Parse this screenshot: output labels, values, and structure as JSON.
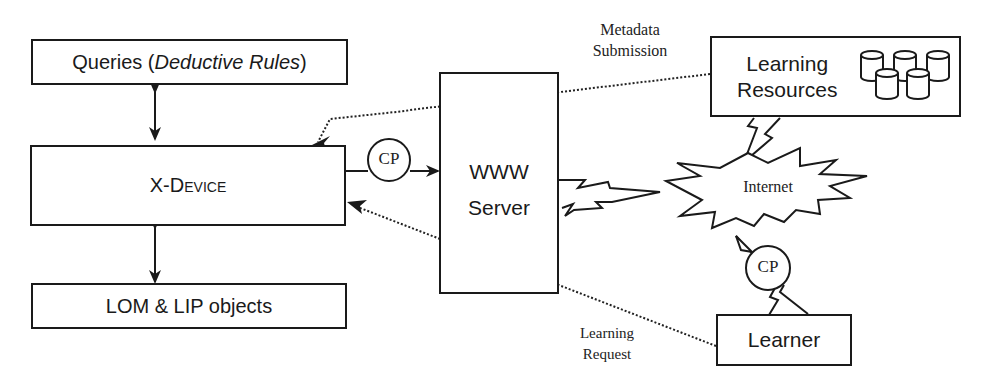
{
  "diagram": {
    "nodes": {
      "queries": {
        "prefix": "Queries (",
        "italic": "Deductive Rules",
        "suffix": ")"
      },
      "xdevice": {
        "label": "X-Device"
      },
      "lom_lip": {
        "label": "LOM & LIP objects"
      },
      "www_server": {
        "line1": "WWW",
        "line2": "Server"
      },
      "learning_resources": {
        "line1": "Learning",
        "line2": "Resources"
      },
      "internet": {
        "label": "Internet"
      },
      "learner": {
        "label": "Learner"
      },
      "cp_server": {
        "label": "CP"
      },
      "cp_learner": {
        "label": "CP"
      }
    },
    "edge_labels": {
      "metadata_submission": {
        "line1": "Metadata",
        "line2": "Submission"
      },
      "learning_request": {
        "line1": "Learning",
        "line2": "Request"
      }
    },
    "edges": [
      {
        "from": "queries",
        "to": "xdevice",
        "style": "solid",
        "arrow": "both"
      },
      {
        "from": "xdevice",
        "to": "lom_lip",
        "style": "solid",
        "arrow": "both"
      },
      {
        "from": "xdevice",
        "to": "www_server",
        "style": "solid",
        "arrow": "end",
        "via": "cp_server"
      },
      {
        "from": "learning_resources",
        "to": "xdevice",
        "style": "dotted",
        "arrow": "end",
        "label": "metadata_submission"
      },
      {
        "from": "learner",
        "to": "xdevice",
        "style": "dotted",
        "arrow": "end",
        "label": "learning_request"
      },
      {
        "from": "www_server",
        "to": "internet",
        "style": "lightning"
      },
      {
        "from": "learning_resources",
        "to": "internet",
        "style": "lightning"
      },
      {
        "from": "learner",
        "to": "internet",
        "style": "lightning",
        "via": "cp_learner"
      }
    ]
  }
}
